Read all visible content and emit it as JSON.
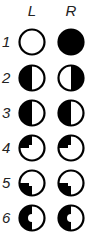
{
  "columns": [
    {
      "label": "L"
    },
    {
      "label": "R"
    }
  ],
  "rows": [
    {
      "label": "1",
      "L": "empty",
      "R": "full"
    },
    {
      "label": "2",
      "L": "left-half",
      "R": "right-half"
    },
    {
      "label": "3",
      "L": "left-half",
      "R": "left-half"
    },
    {
      "label": "4",
      "L": "top-left-quarter",
      "R": "top-left-quarter"
    },
    {
      "label": "5",
      "L": "bottom-left-quarter",
      "R": "bottom-left-quarter"
    },
    {
      "label": "6",
      "L": "left-half-notched",
      "R": "left-half-notched"
    }
  ],
  "colors": {
    "fill": "#000000",
    "background": "#ffffff"
  }
}
